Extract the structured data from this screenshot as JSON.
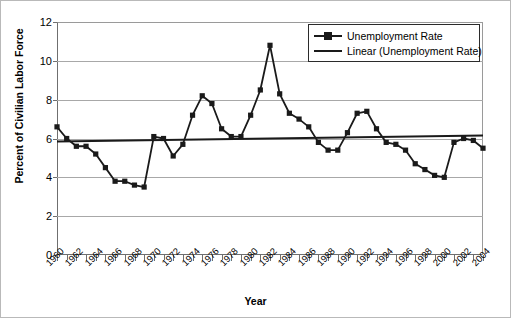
{
  "chart_data": {
    "type": "line",
    "title": "",
    "xlabel": "Year",
    "ylabel": "Percent of Civilian Labor Force",
    "xlim": [
      1960,
      2004
    ],
    "ylim": [
      0,
      12
    ],
    "ytick_step": 2,
    "xtick_step": 2,
    "grid": true,
    "legend_position": "top-right",
    "x": [
      1960,
      1961,
      1962,
      1963,
      1964,
      1965,
      1966,
      1967,
      1968,
      1969,
      1970,
      1971,
      1972,
      1973,
      1974,
      1975,
      1976,
      1977,
      1978,
      1979,
      1980,
      1981,
      1982,
      1983,
      1984,
      1985,
      1986,
      1987,
      1988,
      1989,
      1990,
      1991,
      1992,
      1993,
      1994,
      1995,
      1996,
      1997,
      1998,
      1999,
      2000,
      2001,
      2002,
      2003,
      2004
    ],
    "series": [
      {
        "name": "Unemployment Rate",
        "marker": "square",
        "color": "#1a1a1a",
        "values": [
          6.6,
          6.0,
          5.6,
          5.6,
          5.2,
          4.5,
          3.8,
          3.8,
          3.6,
          3.5,
          6.1,
          6.0,
          5.1,
          5.7,
          7.2,
          8.2,
          7.8,
          6.5,
          6.1,
          6.1,
          7.2,
          8.5,
          10.8,
          8.3,
          7.3,
          7.0,
          6.6,
          5.8,
          5.4,
          5.4,
          6.3,
          7.3,
          7.4,
          6.5,
          5.8,
          5.7,
          5.4,
          4.7,
          4.4,
          4.1,
          4.0,
          5.8,
          6.0,
          5.9,
          5.5
        ]
      },
      {
        "name": "Linear (Unemployment Rate)",
        "type": "trendline",
        "color": "#1a1a1a",
        "endpoints": [
          5.85,
          6.15
        ]
      }
    ],
    "ytick_labels": [
      "0",
      "2",
      "4",
      "6",
      "8",
      "10",
      "12"
    ],
    "ytick_values": [
      0,
      2,
      4,
      6,
      8,
      10,
      12
    ],
    "xtick_labels": [
      "1960",
      "1962",
      "1964",
      "1966",
      "1968",
      "1970",
      "1972",
      "1974",
      "1976",
      "1978",
      "1980",
      "1982",
      "1984",
      "1986",
      "1988",
      "1990",
      "1992",
      "1994",
      "1996",
      "1998",
      "2000",
      "2002",
      "2004"
    ],
    "xtick_values": [
      1960,
      1962,
      1964,
      1966,
      1968,
      1970,
      1972,
      1974,
      1976,
      1978,
      1980,
      1982,
      1984,
      1986,
      1988,
      1990,
      1992,
      1994,
      1996,
      1998,
      2000,
      2002,
      2004
    ]
  },
  "legend": {
    "items": [
      {
        "label": "Unemployment Rate"
      },
      {
        "label": "Linear (Unemployment Rate)"
      }
    ]
  },
  "axes": {
    "y_title": "Percent of Civilian Labor Force",
    "x_title": "Year"
  },
  "colors": {
    "series": "#1a1a1a",
    "grid": "#a8a8a8",
    "frame": "#6f6f6f",
    "background": "#ffffff"
  }
}
